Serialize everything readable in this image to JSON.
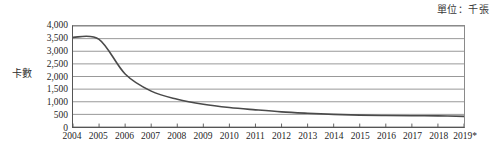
{
  "chart_data": {
    "type": "line",
    "title": "",
    "subtitle": "",
    "unit_note": "單位：千張",
    "xlabel": "",
    "ylabel": "卡數",
    "ylim": [
      0,
      4000
    ],
    "ytick_step": 500,
    "grid": true,
    "legend": "none",
    "categories": [
      "2004",
      "2005",
      "2006",
      "2007",
      "2008",
      "2009",
      "2010",
      "2011",
      "2012",
      "2013",
      "2014",
      "2015",
      "2016",
      "2017",
      "2018",
      "2019*"
    ],
    "ytick_labels": [
      "4,000",
      "3,500",
      "3,000",
      "2,500",
      "2,000",
      "1,500",
      "1,000",
      "500",
      "0"
    ],
    "ytick_values": [
      4000,
      3500,
      3000,
      2500,
      2000,
      1500,
      1000,
      500,
      0
    ],
    "series": [
      {
        "name": "卡數",
        "color": "#4a4a4a",
        "values": [
          3550,
          3470,
          2100,
          1420,
          1100,
          900,
          770,
          680,
          600,
          545,
          500,
          470,
          455,
          445,
          440,
          420
        ]
      }
    ],
    "footnote_marker": "*"
  },
  "axis": {
    "y_title": "卡數",
    "unit_label": "單位：千張"
  }
}
